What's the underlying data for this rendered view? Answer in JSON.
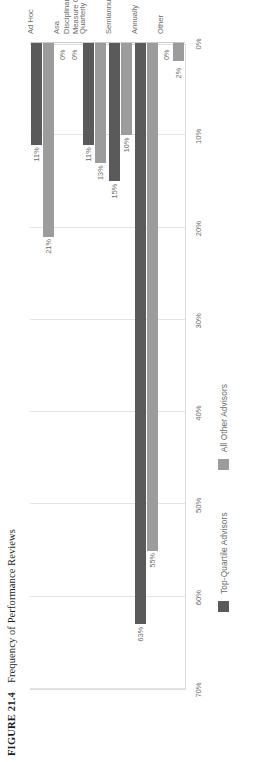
{
  "figure": {
    "number_label": "FIGURE 21.4",
    "caption": "Frequency of Performance Reviews"
  },
  "legend": {
    "position": "bottom",
    "items": [
      {
        "label": "Top-Quartile Advisors",
        "color": "#5a5a5a",
        "swatch_name": "legend-swatch-top-quartile"
      },
      {
        "label": "All Other Advisors",
        "color": "#9c9c9c",
        "swatch_name": "legend-swatch-all-other"
      }
    ]
  },
  "axis": {
    "ticks": [
      "70%",
      "60%",
      "50%",
      "40%",
      "30%",
      "20%",
      "10%",
      "0%"
    ],
    "tick_values": [
      70,
      60,
      50,
      40,
      30,
      20,
      10,
      0
    ]
  },
  "chart_data": {
    "type": "bar",
    "orientation": "horizontal",
    "title": "Frequency of Performance Reviews",
    "xlabel": "",
    "ylabel": "",
    "grid": true,
    "legend_position": "bottom",
    "categories": [
      "Ad Hoc",
      "Asa\nDisciplinary\nMeasure Only",
      "Quarterly",
      "Semiannually",
      "Annually",
      "Other"
    ],
    "xlim": [
      0,
      70
    ],
    "xtick_labels": [
      "0%",
      "10%",
      "20%",
      "30%",
      "40%",
      "50%",
      "60%",
      "70%"
    ],
    "series": [
      {
        "name": "Top-Quartile Advisors",
        "color": "#5a5a5a",
        "values": [
          11,
          0,
          11,
          15,
          63,
          0
        ],
        "labels": [
          "11%",
          "0%",
          "11%",
          "15%",
          "63%",
          "0%"
        ]
      },
      {
        "name": "All Other Advisors",
        "color": "#9c9c9c",
        "values": [
          21,
          0,
          13,
          10,
          55,
          2
        ],
        "labels": [
          "21%",
          "0%",
          "13%",
          "10%",
          "55%",
          "2%"
        ]
      }
    ]
  }
}
